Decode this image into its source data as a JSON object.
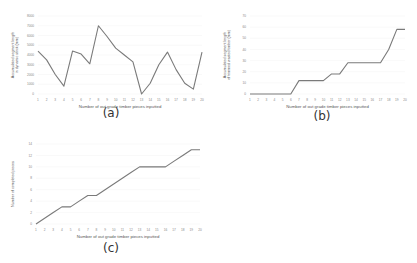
{
  "chart_data": [
    {
      "id": "a",
      "type": "line",
      "panel_label": "(a)",
      "title": "",
      "xlabel": "Number of out grade timber pieces inputted",
      "ylabel_lines": [
        "Accumulated segment length",
        "in dynamic stock (mm)"
      ],
      "ylabel": "Accumulated segment length in dynamic stock (mm)",
      "x": [
        1,
        2,
        3,
        4,
        5,
        6,
        7,
        8,
        9,
        10,
        11,
        12,
        13,
        14,
        15,
        16,
        17,
        18,
        19,
        20
      ],
      "values": [
        4400,
        3500,
        2000,
        800,
        4400,
        4100,
        3100,
        7000,
        5900,
        4700,
        4000,
        3300,
        0,
        1100,
        3000,
        4300,
        2500,
        1100,
        500,
        4300
      ],
      "ylim": [
        0,
        8000
      ],
      "yticks": [
        0,
        1000,
        2000,
        3000,
        4000,
        5000,
        6000,
        7000,
        8000
      ],
      "grid": true,
      "line_color": "#7a7a7a"
    },
    {
      "id": "b",
      "type": "line",
      "panel_label": "(b)",
      "title": "",
      "xlabel": "Number of out grade timber pieces inputted",
      "ylabel_lines": [
        "Accumulated segment length",
        "of trimmed wasted timber (mm)"
      ],
      "ylabel": "Accumulated segment length of trimmed wasted timber (mm)",
      "x": [
        1,
        2,
        3,
        4,
        5,
        6,
        7,
        8,
        9,
        10,
        11,
        12,
        13,
        14,
        15,
        16,
        17,
        18,
        19,
        20
      ],
      "values": [
        0,
        0,
        0,
        0,
        0,
        0,
        12,
        12,
        12,
        12,
        18,
        18,
        28,
        28,
        28,
        28,
        28,
        40,
        58,
        58
      ],
      "ylim": [
        0,
        70
      ],
      "yticks": [
        0,
        10,
        20,
        30,
        40,
        50,
        60,
        70
      ],
      "grid": true,
      "line_color": "#7a7a7a"
    },
    {
      "id": "c",
      "type": "line",
      "panel_label": "(c)",
      "title": "",
      "xlabel": "Number of out grade timber pieces inputted",
      "ylabel_lines": [
        "Number of completed pieces"
      ],
      "ylabel": "Number of completed pieces",
      "x": [
        1,
        2,
        3,
        4,
        5,
        6,
        7,
        8,
        9,
        10,
        11,
        12,
        13,
        14,
        15,
        16,
        17,
        18,
        19,
        20
      ],
      "values": [
        0,
        1,
        2,
        3,
        3,
        4,
        5,
        5,
        6,
        7,
        8,
        9,
        10,
        10,
        10,
        10,
        11,
        12,
        13,
        13
      ],
      "ylim": [
        0,
        14
      ],
      "yticks": [
        0,
        2,
        4,
        6,
        8,
        10,
        12,
        14
      ],
      "grid": true,
      "line_color": "#7a7a7a"
    }
  ],
  "panels": {
    "a": {
      "label": "(a)"
    },
    "b": {
      "label": "(b)"
    },
    "c": {
      "label": "(c)"
    }
  }
}
